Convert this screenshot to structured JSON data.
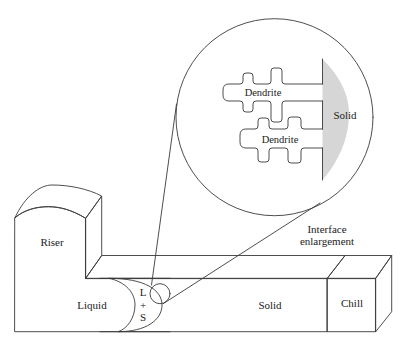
{
  "diagram": {
    "colors": {
      "background": "#ffffff",
      "line": "#3a3a3a",
      "light_gray": "#d6d6d6",
      "mushy_gray": "#a9a9a9",
      "chill_front": "#bdbdbd",
      "chill_top": "#c9c9c9",
      "chill_side": "#b2b2b2"
    },
    "casting": {
      "riser_label": "Riser",
      "liquid_label": "Liquid",
      "mushy_zone_label": [
        "L",
        "+",
        "S"
      ],
      "solid_label": "Solid",
      "chill_label": "Chill"
    },
    "callout": {
      "label_lines": [
        "Interface",
        "enlargement"
      ]
    },
    "enlargement": {
      "dendrites": [
        {
          "label": "Dendrite"
        },
        {
          "label": "Dendrite"
        }
      ],
      "solid_label": "Solid"
    }
  }
}
